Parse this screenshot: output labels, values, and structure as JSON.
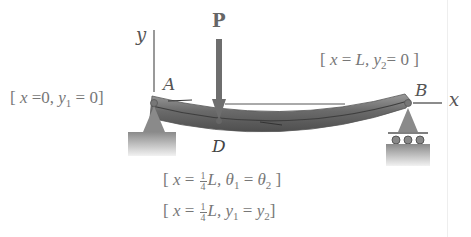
{
  "diagram": {
    "type": "beam-deflection",
    "labels": {
      "y_axis": "y",
      "x_axis": "x",
      "load": "P",
      "point_a": "A",
      "point_b": "B",
      "point_d": "D"
    },
    "boundary_conditions": {
      "left": {
        "open": "[",
        "x_label": "x",
        "eq1": "=0,",
        "y_label": "y",
        "y_sub": "1",
        "eq2": "= 0",
        "close": "]"
      },
      "right": {
        "open": "[",
        "x_label": "x",
        "eq1": "=",
        "L": "L,",
        "y_label": "y",
        "y_sub": "2",
        "eq2": "= 0",
        "close": "]"
      },
      "slope": {
        "open": "[",
        "x_label": "x",
        "eq1": "=",
        "frac_num": "1",
        "frac_den": "4",
        "L": "L,",
        "theta": "θ",
        "sub1": "1",
        "eq2": "=",
        "theta2": "θ",
        "sub2": "2",
        "close": "]"
      },
      "deflection": {
        "open": "[",
        "x_label": "x",
        "eq1": "=",
        "frac_num": "1",
        "frac_den": "4",
        "L": "L,",
        "y1": "y",
        "sub1": "1",
        "eq2": "=",
        "y2": "y",
        "sub2": "2",
        "close": "]"
      }
    },
    "colors": {
      "beam": "#7a7a7a",
      "beam_dark": "#4a4a4a",
      "arrow": "#6e6e6e",
      "support": "#8a8a8a",
      "text": "#777777"
    }
  }
}
